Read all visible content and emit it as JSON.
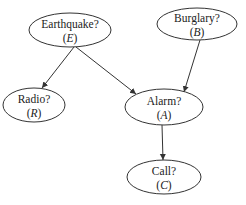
{
  "diagram": {
    "type": "bayesian-network",
    "colors": {
      "stroke": "#333333",
      "text": "#222222",
      "background": "#ffffff"
    },
    "nodes": [
      {
        "id": "E",
        "label": "Earthquake?",
        "var": "E",
        "cx": 70,
        "cy": 30,
        "rx": 41,
        "ry": 17
      },
      {
        "id": "B",
        "label": "Burglary?",
        "var": "B",
        "cx": 197,
        "cy": 24,
        "rx": 40,
        "ry": 16
      },
      {
        "id": "R",
        "label": "Radio?",
        "var": "R",
        "cx": 34,
        "cy": 105,
        "rx": 31,
        "ry": 17
      },
      {
        "id": "A",
        "label": "Alarm?",
        "var": "A",
        "cx": 164,
        "cy": 107,
        "rx": 39,
        "ry": 18
      },
      {
        "id": "C",
        "label": "Call?",
        "var": "C",
        "cx": 164,
        "cy": 177,
        "rx": 37,
        "ry": 17
      }
    ],
    "edges": [
      {
        "from": "E",
        "to": "R",
        "x1": 74,
        "y1": 47,
        "x2": 42,
        "y2": 88
      },
      {
        "from": "E",
        "to": "A",
        "x1": 76,
        "y1": 47,
        "x2": 136,
        "y2": 94
      },
      {
        "from": "B",
        "to": "A",
        "x1": 200,
        "y1": 40,
        "x2": 184,
        "y2": 92
      },
      {
        "from": "A",
        "to": "C",
        "x1": 162,
        "y1": 125,
        "x2": 163,
        "y2": 160
      }
    ]
  }
}
